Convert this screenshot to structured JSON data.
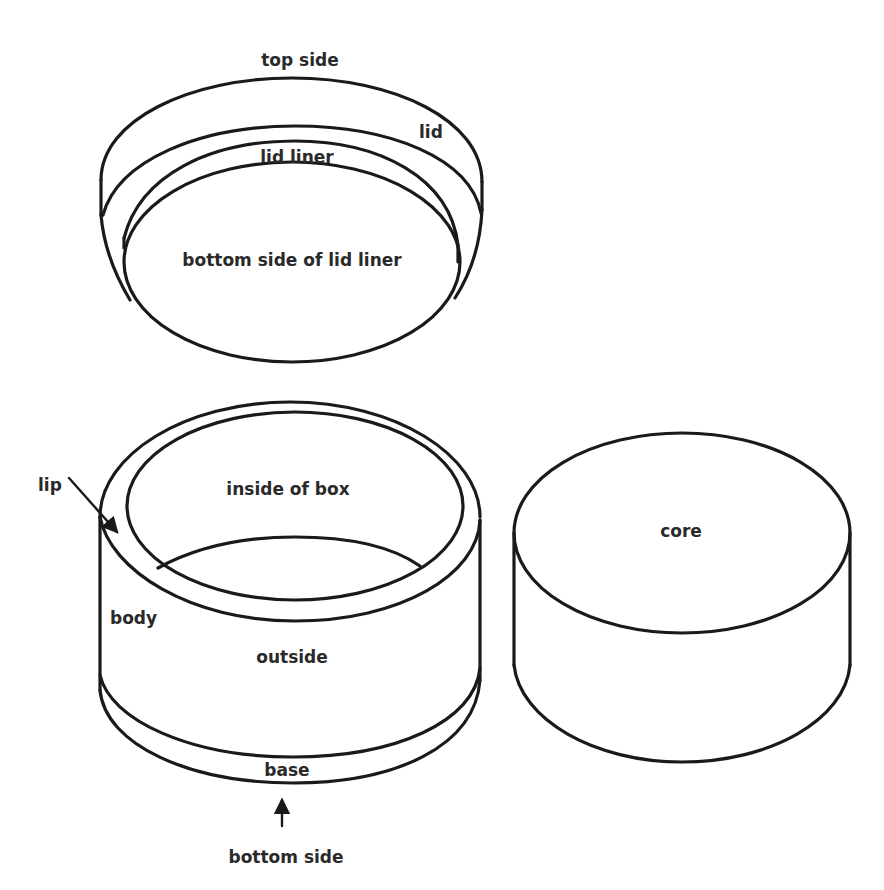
{
  "diagram": {
    "colors": {
      "line": "#1a1a1a",
      "text": "#2a2a2a",
      "background": "#ffffff"
    },
    "lid": {
      "labels": {
        "top_side": "top side",
        "lid": "lid",
        "lid_liner": "lid liner",
        "bottom_side_of_lid_liner": "bottom side of lid liner"
      }
    },
    "box": {
      "labels": {
        "lip": "lip",
        "inside_of_box": "inside of box",
        "body": "body",
        "outside": "outside",
        "base": "base",
        "bottom_side": "bottom side"
      }
    },
    "core": {
      "labels": {
        "core": "core"
      }
    }
  }
}
